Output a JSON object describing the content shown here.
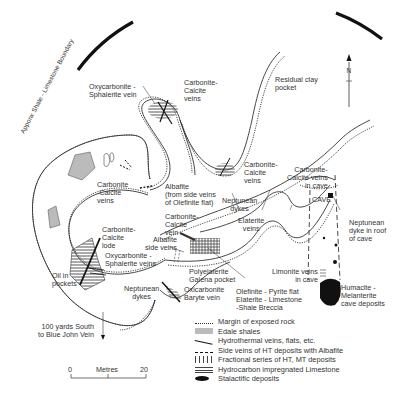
{
  "diagram": {
    "boundary_label": "Apponx Shale - Limestone Boundary",
    "north_label": "N",
    "labels": {
      "oxycarbonite_sphalerite_vein": [
        "Oxycarbonite -",
        "Sphalerite vein"
      ],
      "carbonite_calcite_veins_top": [
        "Carbonite-",
        "Calcite",
        "veins"
      ],
      "residual_clay": [
        "Residual clay",
        "pocket"
      ],
      "carbonite_calcite_veins_left": [
        "Carbonite",
        "-Calcite",
        "veins"
      ],
      "albafite_side": [
        "Albafite",
        "(from side veins",
        "of Olefinite flat)"
      ],
      "carbonite_calcite_veins_mid": [
        "Carbonite-",
        "Calcite",
        "veins"
      ],
      "carbonite_calcite_cave": [
        "Carbonite-",
        "Calcite veins",
        "in cave"
      ],
      "cave": "CAVE",
      "neptunean_dyke_roof": [
        "Neptunean",
        "dyke in roof",
        "of cave"
      ],
      "neptunean_dykes_mid": [
        "Neptunean",
        "dykes"
      ],
      "elaterite_veins": [
        "Elaterite",
        "veins"
      ],
      "carbonite_calcite_vein": [
        "Carbonite-",
        "Calcite",
        "vein"
      ],
      "albafite_side_veins": [
        "Albafite",
        "side veins"
      ],
      "carbonite_calcite_lode": [
        "Carbonite-",
        "Calcite",
        "lode"
      ],
      "oxycarbonite_sphalerite_veins": [
        "Oxycarbonite -",
        "Sphalerite veins"
      ],
      "oil_in_pockets": [
        "Oil in",
        "pockets"
      ],
      "polyelaterite": [
        "Polyelaterite",
        "Galena pocket"
      ],
      "oxicarbonite_baryte": [
        "Oxicarbonite",
        "Baryte vein"
      ],
      "olefinite": [
        "Olefinite - Pyrite flat",
        "Elaterite - Limestone",
        "-Shale Breccia"
      ],
      "neptunean_dykes_low": [
        "Neptunean",
        "dykes"
      ],
      "limonite": [
        "Limonite veins",
        "in cave"
      ],
      "humacite": [
        "Humacite -",
        "Melanterite",
        "cave deposits"
      ],
      "south_note": [
        "100 yards South",
        "to Blue John Vein"
      ]
    },
    "scale": {
      "start": "0",
      "unit": "Metres",
      "end": "20"
    },
    "legend": [
      {
        "symbol": "dotted-margin",
        "label": "Margin of exposed rock"
      },
      {
        "symbol": "grey-fill",
        "label": "Edale shales"
      },
      {
        "symbol": "solid-line",
        "label": "Hydrothermal veins, flats, etc."
      },
      {
        "symbol": "dashed-line",
        "label": "Side veins of HT deposits with Albafite"
      },
      {
        "symbol": "vertical-bars",
        "label": "Fractional series of HT, MT deposits"
      },
      {
        "symbol": "horizontal-hatch",
        "label": "Hydrocarbon impregnated Limestone"
      },
      {
        "symbol": "black-blob",
        "label": "Stalactific deposits"
      }
    ]
  }
}
